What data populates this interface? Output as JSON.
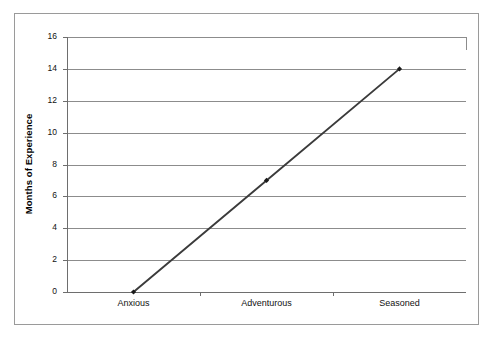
{
  "chart_data": {
    "type": "line",
    "title": "",
    "xlabel": "",
    "ylabel": "Months of Experience",
    "categories": [
      "Anxious",
      "Adventurous",
      "Seasoned"
    ],
    "values": [
      0,
      7,
      14
    ],
    "series": [
      {
        "name": "Months of Experience",
        "values": [
          0,
          7,
          14
        ]
      }
    ],
    "ylim": [
      0,
      16
    ],
    "ytick_step": 2,
    "yticks": [
      0,
      2,
      4,
      6,
      8,
      10,
      12,
      14,
      16
    ],
    "ytick_labels": [
      "0",
      "2",
      "4",
      "6",
      "8",
      "10",
      "12",
      "14",
      "16"
    ],
    "grid": "horizontal",
    "legend": "none",
    "marker": "diamond",
    "colors": {
      "line": "#3b3b3b",
      "marker": "#1a1a1a",
      "gridline": "#8c8c8c",
      "axis": "#6e6e6e",
      "frame": "#9a9a9a",
      "background": "#ffffff",
      "text": "#111111"
    }
  }
}
